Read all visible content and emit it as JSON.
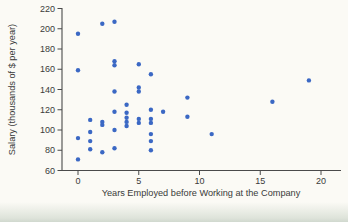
{
  "chart_data": {
    "type": "scatter",
    "title": "",
    "xlabel": "Years Employed before Working at the Company",
    "ylabel": "Salary (thousands of $ per year)",
    "xlim": [
      -1.3,
      21.6
    ],
    "ylim": [
      60,
      220
    ],
    "x_ticks": [
      0,
      5,
      10,
      15,
      20
    ],
    "y_ticks": [
      60,
      80,
      100,
      120,
      140,
      160,
      180,
      200,
      220
    ],
    "grid": false,
    "legend": false,
    "marker_color": "#3b68c4",
    "axis_color": "#4a4a4a",
    "points": [
      [
        0,
        195
      ],
      [
        0,
        159
      ],
      [
        0,
        92
      ],
      [
        0,
        71
      ],
      [
        1,
        110
      ],
      [
        1,
        98
      ],
      [
        1,
        89
      ],
      [
        1,
        81
      ],
      [
        2,
        205
      ],
      [
        2,
        108
      ],
      [
        2,
        105
      ],
      [
        2,
        78
      ],
      [
        3,
        207
      ],
      [
        3,
        168
      ],
      [
        3,
        164
      ],
      [
        3,
        138
      ],
      [
        3,
        118
      ],
      [
        3,
        100
      ],
      [
        3,
        82
      ],
      [
        4,
        125
      ],
      [
        4,
        117
      ],
      [
        4,
        112
      ],
      [
        4,
        108
      ],
      [
        4,
        104
      ],
      [
        5,
        165
      ],
      [
        5,
        142
      ],
      [
        5,
        138
      ],
      [
        5,
        111
      ],
      [
        5,
        107
      ],
      [
        6,
        155
      ],
      [
        6,
        120
      ],
      [
        6,
        111
      ],
      [
        6,
        107
      ],
      [
        6,
        96
      ],
      [
        6,
        89
      ],
      [
        6,
        80
      ],
      [
        7,
        118
      ],
      [
        9,
        132
      ],
      [
        9,
        113
      ],
      [
        11,
        96
      ],
      [
        16,
        128
      ],
      [
        19,
        149
      ]
    ]
  }
}
